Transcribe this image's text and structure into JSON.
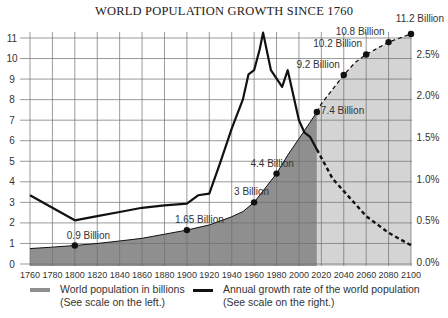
{
  "chart_data": {
    "type": "area+line",
    "title": "WORLD POPULATION GROWTH SINCE 1760",
    "x_ticks": [
      1760,
      1780,
      1800,
      1820,
      1840,
      1860,
      1880,
      1900,
      1920,
      1940,
      1960,
      1980,
      2000,
      2020,
      2040,
      2060,
      2080,
      2100
    ],
    "left_axis": {
      "label": "World population in billions",
      "ticks": [
        0,
        1,
        2,
        3,
        4,
        5,
        6,
        7,
        8,
        9,
        10,
        11
      ],
      "range": [
        0,
        11
      ]
    },
    "right_axis": {
      "label": "Annual growth rate",
      "ticks": [
        "0.0%",
        "0.5%",
        "1.0%",
        "1.5%",
        "2.0%",
        "2.5%"
      ],
      "range": [
        0,
        2.7
      ]
    },
    "series": [
      {
        "name": "World population in billions",
        "axis": "left",
        "style": "area",
        "historical": {
          "x": [
            1760,
            1780,
            1800,
            1820,
            1840,
            1860,
            1880,
            1900,
            1920,
            1940,
            1950,
            1960,
            1970,
            1980,
            1990,
            2000,
            2010,
            2016
          ],
          "values": [
            0.75,
            0.82,
            0.9,
            1.0,
            1.12,
            1.25,
            1.45,
            1.65,
            1.9,
            2.3,
            2.55,
            3.0,
            3.7,
            4.4,
            5.3,
            6.1,
            6.9,
            7.4
          ]
        },
        "projected": {
          "x": [
            2016,
            2020,
            2030,
            2040,
            2050,
            2060,
            2070,
            2080,
            2090,
            2100
          ],
          "values": [
            7.4,
            7.8,
            8.5,
            9.2,
            9.8,
            10.2,
            10.5,
            10.8,
            11.0,
            11.2
          ]
        }
      },
      {
        "name": "Annual growth rate of the world population",
        "axis": "right",
        "style": "line",
        "historical": {
          "x": [
            1760,
            1800,
            1820,
            1840,
            1860,
            1880,
            1900,
            1910,
            1920,
            1930,
            1940,
            1950,
            1955,
            1960,
            1965,
            1968,
            1975,
            1985,
            1990,
            2000,
            2005,
            2010,
            2016
          ],
          "values": [
            0.8,
            0.5,
            0.55,
            0.6,
            0.65,
            0.68,
            0.7,
            0.8,
            0.82,
            1.2,
            1.6,
            1.95,
            2.25,
            2.3,
            2.55,
            2.75,
            2.3,
            2.1,
            2.3,
            1.7,
            1.55,
            1.5,
            1.35
          ]
        },
        "projected": {
          "x": [
            2016,
            2030,
            2040,
            2060,
            2080,
            2100
          ],
          "values": [
            1.35,
            1.0,
            0.85,
            0.55,
            0.35,
            0.2
          ]
        }
      }
    ],
    "annotations": [
      {
        "x": 1800,
        "value": 0.9,
        "label": "0.9 Billion"
      },
      {
        "x": 1900,
        "value": 1.65,
        "label": "1.65 Billion"
      },
      {
        "x": 1960,
        "value": 3.0,
        "label": "3 Billion"
      },
      {
        "x": 1980,
        "value": 4.4,
        "label": "4.4 Billion"
      },
      {
        "x": 2016,
        "value": 7.4,
        "label": "7.4 Billion"
      },
      {
        "x": 2040,
        "value": 9.2,
        "label": "9.2 Billion"
      },
      {
        "x": 2060,
        "value": 10.2,
        "label": "10.2 Billion"
      },
      {
        "x": 2080,
        "value": 10.8,
        "label": "10.8 Billion"
      },
      {
        "x": 2100,
        "value": 11.2,
        "label": "11.2 Billion"
      }
    ],
    "legend": [
      {
        "line1": "World population in billions",
        "line2": "(See scale on the left.)",
        "swatch": "#8c8c8c"
      },
      {
        "line1": "Annual growth rate of the world population",
        "line2": "(See scale on the right.)",
        "swatch": "#111111"
      }
    ],
    "grid": true,
    "legend_position": "bottom"
  },
  "colors": {
    "area_historical": "#8f8f8f",
    "area_projected": "#d4d4d4",
    "line": "#111111",
    "grid": "#6e6e6e"
  }
}
